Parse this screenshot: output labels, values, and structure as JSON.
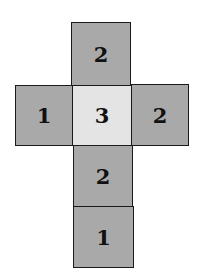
{
  "diagram": {
    "type": "cube-net",
    "faces": [
      {
        "id": "top",
        "label": "2",
        "shade": "dark"
      },
      {
        "id": "left",
        "label": "1",
        "shade": "dark"
      },
      {
        "id": "center",
        "label": "3",
        "shade": "light"
      },
      {
        "id": "right",
        "label": "2",
        "shade": "dark"
      },
      {
        "id": "below-center",
        "label": "2",
        "shade": "dark"
      },
      {
        "id": "bottom",
        "label": "1",
        "shade": "dark"
      }
    ]
  }
}
